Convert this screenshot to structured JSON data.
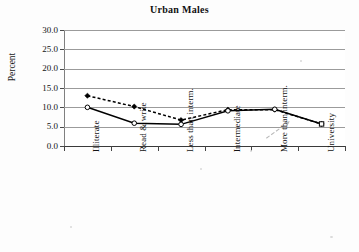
{
  "chart_data": {
    "type": "line",
    "title": "Urban Males",
    "xlabel": "",
    "ylabel": "Percent",
    "ylim": [
      0.0,
      30.0
    ],
    "ytick_step": 5.0,
    "ytick_labels": [
      "0.0",
      "5.0",
      "10.0",
      "15.0",
      "20.0",
      "25.0",
      "30.0"
    ],
    "grid": true,
    "legend": "none",
    "categories": [
      "Illiterate",
      "Read & write",
      "Less than interm.",
      "Intermediate",
      "More than interm.",
      "University"
    ],
    "series": [
      {
        "name": "series-dashed",
        "marker": "filled-diamond",
        "linestyle": "dashed",
        "color": "#000000",
        "values": [
          13.0,
          10.2,
          6.7,
          9.4,
          9.4,
          5.7
        ]
      },
      {
        "name": "series-solid",
        "marker": "open-circle",
        "linestyle": "solid",
        "color": "#000000",
        "values": [
          10.0,
          5.9,
          5.6,
          9.1,
          9.5,
          5.7
        ]
      }
    ],
    "annotations": [
      {
        "name": "pointer-arrow",
        "type": "arrow",
        "color": "#b9b9b9",
        "from": [
          0.72,
          2.0
        ],
        "to": [
          0.8,
          6.2
        ]
      }
    ]
  }
}
